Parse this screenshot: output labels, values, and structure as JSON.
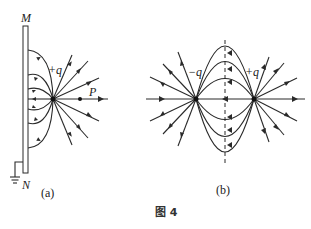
{
  "figure": {
    "caption": "图 4",
    "panel_a": {
      "sublabel": "(a)",
      "plate_top_label": "M",
      "plate_bottom_label": "N",
      "charge_label": "+q",
      "point_label": "P",
      "description": "Point charge +q near a grounded conducting plate MN; field lines run from +q outward and into the plate"
    },
    "panel_b": {
      "sublabel": "(b)",
      "negative_charge_label": "−q",
      "positive_charge_label": "+q",
      "description": "Electric dipole field lines from +q to −q with dashed perpendicular bisector"
    },
    "colors": {
      "ink": "#2a2a2a",
      "background": "#ffffff"
    }
  }
}
